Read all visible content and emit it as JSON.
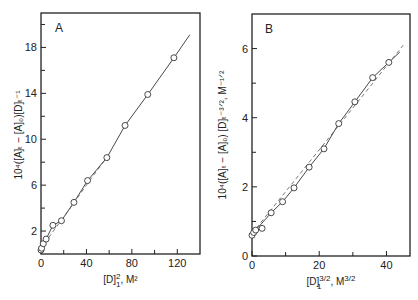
{
  "chart_data": [
    {
      "type": "line",
      "panel": "A",
      "title": "",
      "panel_label": "A",
      "xlabel": "[D]²₁, M²",
      "xlabel_main": "[D]",
      "xlabel_sup": "2",
      "xlabel_sub": "1",
      "xlabel_rest": ", M²",
      "ylabel": "10⁴([A]ₜ − [A]₀)[D]ₜ⁻¹",
      "xlim": [
        0,
        140
      ],
      "ylim": [
        0,
        21
      ],
      "xticks": [
        0,
        40,
        80,
        120
      ],
      "xminor": [
        20,
        60,
        100
      ],
      "yticks": [
        2,
        6,
        10,
        14,
        18
      ],
      "yminor": [
        4,
        8,
        12,
        16,
        20
      ],
      "grid": false,
      "series": [
        {
          "name": "data points",
          "style": "markers",
          "marker": "open-circle",
          "x": [
            0,
            0.5,
            2,
            4.5,
            10.5,
            18,
            29,
            41,
            58,
            74,
            94,
            117
          ],
          "y": [
            0.35,
            0.5,
            0.9,
            1.3,
            2.5,
            2.9,
            4.5,
            6.4,
            8.4,
            11.2,
            13.9,
            17.1
          ]
        },
        {
          "name": "solid fit",
          "style": "solid",
          "x": [
            0,
            2,
            4.5,
            10.5,
            18,
            29,
            41,
            58,
            74,
            94,
            117,
            131
          ],
          "y": [
            0.35,
            0.9,
            1.3,
            2.5,
            2.9,
            4.5,
            6.4,
            8.4,
            11.2,
            13.9,
            17.1,
            19.1
          ]
        },
        {
          "name": "dashed fit",
          "style": "dashed",
          "x": [
            0,
            10,
            20,
            40,
            60
          ],
          "y": [
            0.4,
            1.9,
            3.2,
            6.0,
            8.7
          ]
        }
      ]
    },
    {
      "type": "line",
      "panel": "B",
      "title": "",
      "panel_label": "B",
      "xlabel": "[D]³ᐟ²₁, M³ᐟ²",
      "xlabel_main": "[D]",
      "xlabel_sup": "3/2",
      "xlabel_sub": "1",
      "xlabel_rest": ", M",
      "xlabel_rest_sup": "3/2",
      "ylabel": "10⁴([A]ₜ − [A]₀) [D]ₜ⁻³ᐟ², M⁻¹ᐟ²",
      "xlim": [
        0,
        47
      ],
      "ylim": [
        0,
        7
      ],
      "xticks": [
        0,
        20,
        40
      ],
      "xminor": [
        10,
        30
      ],
      "yticks": [
        0,
        2,
        4,
        6
      ],
      "yminor": [
        1,
        3,
        5,
        7
      ],
      "grid": false,
      "series": [
        {
          "name": "data points",
          "style": "markers",
          "marker": "open-circle",
          "x": [
            0,
            0.5,
            1.1,
            3,
            5.7,
            9.1,
            12.5,
            17,
            21.4,
            25.8,
            30.6,
            35.9,
            40.7
          ],
          "y": [
            0.6,
            0.68,
            0.75,
            0.8,
            1.25,
            1.57,
            1.97,
            2.57,
            3.1,
            3.83,
            4.46,
            5.16,
            5.6
          ]
        },
        {
          "name": "solid fit",
          "style": "solid",
          "x": [
            0,
            1.1,
            5.7,
            9.1,
            12.5,
            17,
            21.4,
            25.8,
            30.6,
            35.9,
            40.7,
            44
          ],
          "y": [
            0.6,
            0.75,
            1.25,
            1.57,
            1.97,
            2.57,
            3.1,
            3.83,
            4.46,
            5.16,
            5.6,
            5.9
          ]
        },
        {
          "name": "dashed fit",
          "style": "dashed",
          "x": [
            0,
            45
          ],
          "y": [
            0.65,
            6.1
          ]
        }
      ]
    }
  ],
  "panels": {
    "A": {
      "letter": "A",
      "x_tick_labels": [
        "0",
        "40",
        "80",
        "120"
      ],
      "y_tick_labels": [
        "2",
        "6",
        "10",
        "14",
        "18"
      ]
    },
    "B": {
      "letter": "B",
      "x_tick_labels": [
        "0",
        "20",
        "40"
      ],
      "y_tick_labels": [
        "0",
        "2",
        "4",
        "6"
      ]
    }
  }
}
